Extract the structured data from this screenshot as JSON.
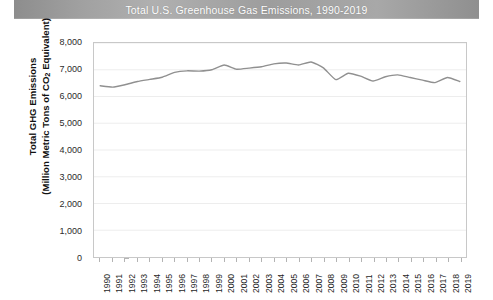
{
  "chart_data": {
    "type": "line",
    "title": "Total U.S. Greenhouse Gas Emissions, 1990-2019",
    "xlabel": "",
    "ylabel": "Total GHG Emissions (Million Metric Tons of CO2 Equivalent)",
    "ylabel_line1": "Total GHG  Emissions",
    "ylabel_line2_pre": "(Million Metric Tons of CO",
    "ylabel_line2_sub": "2",
    "ylabel_line2_post": " Equivalent)",
    "ylim": [
      0,
      8000
    ],
    "ytick_labels": [
      "0",
      "1,000",
      "2,000",
      "3,000",
      "4,000",
      "5,000",
      "6,000",
      "7,000",
      "8,000"
    ],
    "ytick_values": [
      0,
      1000,
      2000,
      3000,
      4000,
      5000,
      6000,
      7000,
      8000
    ],
    "grid": true,
    "grid_axis": "y",
    "legend": false,
    "line_color": "#909090",
    "grid_color": "#ededed",
    "axis_color": "#c8c8c8",
    "categories": [
      "1990",
      "1991",
      "1992",
      "1993",
      "1994",
      "1995",
      "1996",
      "1997",
      "1998",
      "1999",
      "2000",
      "2001",
      "2002",
      "2003",
      "2004",
      "2005",
      "2006",
      "2007",
      "2008",
      "2009",
      "2010",
      "2011",
      "2012",
      "2013",
      "2014",
      "2015",
      "2016",
      "2017",
      "2018",
      "2019"
    ],
    "values": [
      6400,
      6350,
      6440,
      6560,
      6640,
      6720,
      6900,
      6960,
      6950,
      7000,
      7180,
      7020,
      7060,
      7110,
      7220,
      7250,
      7180,
      7290,
      7070,
      6630,
      6870,
      6760,
      6580,
      6740,
      6810,
      6710,
      6610,
      6520,
      6710,
      6560
    ],
    "series": [
      {
        "name": "Total GHG Emissions",
        "values": [
          6400,
          6350,
          6440,
          6560,
          6640,
          6720,
          6900,
          6960,
          6950,
          7000,
          7180,
          7020,
          7060,
          7110,
          7220,
          7250,
          7180,
          7290,
          7070,
          6630,
          6870,
          6760,
          6580,
          6740,
          6810,
          6710,
          6610,
          6520,
          6710,
          6560
        ]
      }
    ]
  },
  "title_banner": {
    "text": "Total U.S. Greenhouse Gas Emissions, 1990-2019"
  }
}
